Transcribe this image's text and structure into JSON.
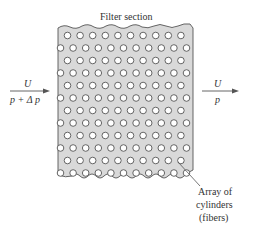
{
  "figure": {
    "title": "Filter section",
    "inlet": {
      "velocity_label": "U",
      "pressure_label": "p + Δ p"
    },
    "outlet": {
      "velocity_label": "U",
      "pressure_label": "p"
    },
    "callout": {
      "line1": "Array of",
      "line2": "cylinders",
      "line3": "(fibers)"
    },
    "colors": {
      "filter_fill": "#d9d9d9",
      "stroke": "#555555",
      "circle_fill": "#ffffff"
    },
    "array": {
      "rows": 12,
      "row_counts": [
        10,
        11,
        10,
        11,
        10,
        11,
        10,
        11,
        10,
        11,
        10,
        11
      ]
    }
  }
}
